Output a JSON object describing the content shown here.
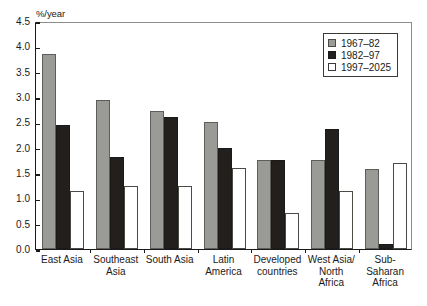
{
  "chart_data": {
    "type": "bar",
    "title": "",
    "subtitle": "",
    "xlabel": "",
    "ylabel": "%/year",
    "ylim": [
      0.0,
      4.5
    ],
    "ytick_labels": [
      "0.0",
      "0.5",
      "1.0",
      "1.5",
      "2.0",
      "2.5",
      "3.0",
      "3.5",
      "4.0",
      "4.5"
    ],
    "ytick_values": [
      0.0,
      0.5,
      1.0,
      1.5,
      2.0,
      2.5,
      3.0,
      3.5,
      4.0,
      4.5
    ],
    "grid": false,
    "legend_position": "top-right",
    "categories": [
      "East Asia",
      "Southeast\nAsia",
      "South Asia",
      "Latin\nAmerica",
      "Developed\ncountries",
      "West Asia/\nNorth\nAfrica",
      "Sub-\nSaharan\nAfrica"
    ],
    "series": [
      {
        "name": "1967–82",
        "color": "#9a9a96",
        "values": [
          3.85,
          2.95,
          2.72,
          2.5,
          1.75,
          1.75,
          1.58
        ]
      },
      {
        "name": "1982–97",
        "color": "#231f1c",
        "values": [
          2.45,
          1.82,
          2.6,
          2.0,
          1.75,
          2.37,
          0.1
        ]
      },
      {
        "name": "1997–2025",
        "color": "#ffffff",
        "values": [
          1.15,
          1.25,
          1.25,
          1.6,
          0.72,
          1.15,
          1.7
        ]
      }
    ]
  },
  "legend": {
    "items": [
      {
        "label": "1967–82"
      },
      {
        "label": "1982–97"
      },
      {
        "label": "1997–2025"
      }
    ]
  }
}
